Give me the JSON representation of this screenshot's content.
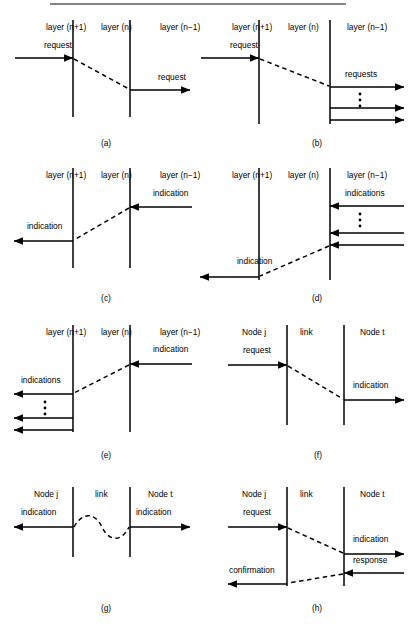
{
  "figure": {
    "width": 416,
    "height": 633,
    "background": "#ffffff",
    "ink_color": "#000000",
    "rule_color": "#5a5a5a",
    "separator_rule": {
      "x1": 50,
      "x2": 346,
      "y": 4
    }
  },
  "panels": [
    {
      "id": "panel-a",
      "caption": "(a)",
      "caption_pos": {
        "x": 106,
        "y": 146
      },
      "origin": {
        "x": 0,
        "y": 0
      },
      "columns": [
        {
          "name": "left",
          "label": "layer (n+1)",
          "label_x": 46,
          "label_y": 30,
          "line_x": 73,
          "line_y1": 20,
          "line_y2": 117
        },
        {
          "name": "middle",
          "label": "layer (n)",
          "label_x": 101,
          "label_y": 30,
          "line_x": 130,
          "line_y1": 20,
          "line_y2": 117
        },
        {
          "name": "right",
          "label": "layer (n−1)",
          "label_x": 160,
          "label_y": 30,
          "line_x": null,
          "line_y1": null,
          "line_y2": null
        }
      ],
      "arrows": [
        {
          "name": "request-in",
          "label": "request",
          "label_x": 44,
          "label_y": 48,
          "x1": 15,
          "y1": 58,
          "x2": 73,
          "y2": 58,
          "dir": "right"
        },
        {
          "name": "request-out",
          "label": "request",
          "label_x": 158,
          "label_y": 80,
          "x1": 130,
          "y1": 90,
          "x2": 190,
          "y2": 90,
          "dir": "right"
        }
      ],
      "mappings": [
        {
          "name": "request-mapping",
          "x1": 74,
          "y1": 59,
          "x2": 129,
          "y2": 89
        }
      ],
      "ellipses": []
    },
    {
      "id": "panel-b",
      "caption": "(b)",
      "caption_pos": {
        "x": 317,
        "y": 146
      },
      "origin": {
        "x": 0,
        "y": 0
      },
      "columns": [
        {
          "name": "left",
          "label": "layer (n+1)",
          "label_x": 232,
          "label_y": 30,
          "line_x": 259,
          "line_y1": 20,
          "line_y2": 124
        },
        {
          "name": "middle",
          "label": "layer (n)",
          "label_x": 288,
          "label_y": 30,
          "line_x": 330,
          "line_y1": 20,
          "line_y2": 124
        },
        {
          "name": "right",
          "label": "layer (n−1)",
          "label_x": 347,
          "label_y": 30,
          "line_x": null,
          "line_y1": null,
          "line_y2": null
        }
      ],
      "arrows": [
        {
          "name": "request-in",
          "label": "request",
          "label_x": 230,
          "label_y": 48,
          "x1": 201,
          "y1": 58,
          "x2": 259,
          "y2": 58,
          "dir": "right"
        },
        {
          "name": "requests-out-1",
          "label": "requests",
          "label_x": 345,
          "label_y": 77,
          "x1": 330,
          "y1": 87,
          "x2": 404,
          "y2": 87,
          "dir": "right"
        },
        {
          "name": "requests-out-2",
          "label": "",
          "label_x": 0,
          "label_y": 0,
          "x1": 330,
          "y1": 108,
          "x2": 404,
          "y2": 108,
          "dir": "right"
        },
        {
          "name": "requests-out-3",
          "label": "",
          "label_x": 0,
          "label_y": 0,
          "x1": 330,
          "y1": 120,
          "x2": 404,
          "y2": 120,
          "dir": "right"
        }
      ],
      "mappings": [
        {
          "name": "request-mapping",
          "x1": 260,
          "y1": 59,
          "x2": 329,
          "y2": 86
        }
      ],
      "ellipses": [
        {
          "name": "requests-ellipsis",
          "x": 360,
          "y_start": 94,
          "count": 3,
          "spacing": 6,
          "r": 1.4
        }
      ]
    },
    {
      "id": "panel-c",
      "caption": "(c)",
      "caption_pos": {
        "x": 106,
        "y": 301
      },
      "origin": {
        "x": 0,
        "y": 0
      },
      "columns": [
        {
          "name": "left",
          "label": "layer (n+1)",
          "label_x": 46,
          "label_y": 178,
          "line_x": 73,
          "line_y1": 168,
          "line_y2": 268
        },
        {
          "name": "middle",
          "label": "layer (n)",
          "label_x": 101,
          "label_y": 178,
          "line_x": 130,
          "line_y1": 168,
          "line_y2": 268
        },
        {
          "name": "right",
          "label": "layer (n−1)",
          "label_x": 160,
          "label_y": 178,
          "line_x": null,
          "line_y1": null,
          "line_y2": null
        }
      ],
      "arrows": [
        {
          "name": "indication-in",
          "label": "indication",
          "label_x": 153,
          "label_y": 196,
          "x1": 192,
          "y1": 207,
          "x2": 130,
          "y2": 207,
          "dir": "left"
        },
        {
          "name": "indication-out",
          "label": "indication",
          "label_x": 27,
          "label_y": 229,
          "x1": 73,
          "y1": 241,
          "x2": 14,
          "y2": 241,
          "dir": "left"
        }
      ],
      "mappings": [
        {
          "name": "indication-mapping",
          "x1": 129,
          "y1": 208,
          "x2": 74,
          "y2": 240
        }
      ],
      "ellipses": []
    },
    {
      "id": "panel-d",
      "caption": "(d)",
      "caption_pos": {
        "x": 317,
        "y": 301
      },
      "origin": {
        "x": 0,
        "y": 0
      },
      "columns": [
        {
          "name": "left",
          "label": "layer (n+1)",
          "label_x": 232,
          "label_y": 178,
          "line_x": 259,
          "line_y1": 168,
          "line_y2": 280
        },
        {
          "name": "middle",
          "label": "layer (n)",
          "label_x": 288,
          "label_y": 178,
          "line_x": 330,
          "line_y1": 168,
          "line_y2": 280
        },
        {
          "name": "right",
          "label": "layer (n−1)",
          "label_x": 347,
          "label_y": 178,
          "line_x": null,
          "line_y1": null,
          "line_y2": null
        }
      ],
      "arrows": [
        {
          "name": "indications-in-1",
          "label": "indications",
          "label_x": 345,
          "label_y": 196,
          "x1": 404,
          "y1": 206,
          "x2": 330,
          "y2": 206,
          "dir": "left"
        },
        {
          "name": "indications-in-2",
          "label": "",
          "label_x": 0,
          "label_y": 0,
          "x1": 404,
          "y1": 233,
          "x2": 330,
          "y2": 233,
          "dir": "left"
        },
        {
          "name": "indications-in-3",
          "label": "",
          "label_x": 0,
          "label_y": 0,
          "x1": 404,
          "y1": 245,
          "x2": 330,
          "y2": 245,
          "dir": "left"
        },
        {
          "name": "indication-out",
          "label": "indication",
          "label_x": 237,
          "label_y": 264,
          "x1": 259,
          "y1": 277,
          "x2": 200,
          "y2": 277,
          "dir": "left"
        }
      ],
      "mappings": [
        {
          "name": "indication-mapping",
          "x1": 329,
          "y1": 246,
          "x2": 260,
          "y2": 276
        }
      ],
      "ellipses": [
        {
          "name": "indications-ellipsis",
          "x": 360,
          "y_start": 214,
          "count": 3,
          "spacing": 6,
          "r": 1.4
        }
      ]
    },
    {
      "id": "panel-e",
      "caption": "(e)",
      "caption_pos": {
        "x": 106,
        "y": 458
      },
      "origin": {
        "x": 0,
        "y": 0
      },
      "columns": [
        {
          "name": "left",
          "label": "layer (n+1)",
          "label_x": 46,
          "label_y": 335,
          "line_x": 73,
          "line_y1": 325,
          "line_y2": 432
        },
        {
          "name": "middle",
          "label": "layer (n)",
          "label_x": 101,
          "label_y": 335,
          "line_x": 130,
          "line_y1": 325,
          "line_y2": 432
        },
        {
          "name": "right",
          "label": "layer (n−1)",
          "label_x": 160,
          "label_y": 335,
          "line_x": null,
          "line_y1": null,
          "line_y2": null
        }
      ],
      "arrows": [
        {
          "name": "indication-in",
          "label": "indication",
          "label_x": 153,
          "label_y": 352,
          "x1": 192,
          "y1": 364,
          "x2": 130,
          "y2": 364,
          "dir": "left"
        },
        {
          "name": "indications-out-1",
          "label": "indications",
          "label_x": 21,
          "label_y": 383,
          "x1": 73,
          "y1": 394,
          "x2": 14,
          "y2": 394,
          "dir": "left"
        },
        {
          "name": "indications-out-2",
          "label": "",
          "label_x": 0,
          "label_y": 0,
          "x1": 73,
          "y1": 418,
          "x2": 14,
          "y2": 418,
          "dir": "left"
        },
        {
          "name": "indications-out-3",
          "label": "",
          "label_x": 0,
          "label_y": 0,
          "x1": 73,
          "y1": 430,
          "x2": 14,
          "y2": 430,
          "dir": "left"
        }
      ],
      "mappings": [
        {
          "name": "indication-mapping",
          "x1": 129,
          "y1": 365,
          "x2": 74,
          "y2": 393
        }
      ],
      "ellipses": [
        {
          "name": "indications-ellipsis",
          "x": 45,
          "y_start": 402,
          "count": 3,
          "spacing": 6,
          "r": 1.4
        }
      ]
    },
    {
      "id": "panel-f",
      "caption": "(f)",
      "caption_pos": {
        "x": 318,
        "y": 458
      },
      "origin": {
        "x": 0,
        "y": 0
      },
      "columns": [
        {
          "name": "left",
          "label": "Node j",
          "label_x": 242,
          "label_y": 335,
          "line_x": 287,
          "line_y1": 325,
          "line_y2": 425
        },
        {
          "name": "middle",
          "label": "link",
          "label_x": 300,
          "label_y": 335,
          "line_x": 344,
          "line_y1": 325,
          "line_y2": 425
        },
        {
          "name": "right",
          "label": "Node t",
          "label_x": 360,
          "label_y": 335,
          "line_x": null,
          "line_y1": null,
          "line_y2": null
        }
      ],
      "arrows": [
        {
          "name": "request-in",
          "label": "request",
          "label_x": 243,
          "label_y": 353,
          "x1": 228,
          "y1": 365,
          "x2": 287,
          "y2": 365,
          "dir": "right"
        },
        {
          "name": "indication-out",
          "label": "indication",
          "label_x": 353,
          "label_y": 388,
          "x1": 344,
          "y1": 400,
          "x2": 404,
          "y2": 400,
          "dir": "right"
        }
      ],
      "mappings": [
        {
          "name": "request-indication-mapping",
          "x1": 288,
          "y1": 366,
          "x2": 343,
          "y2": 399
        }
      ],
      "ellipses": []
    },
    {
      "id": "panel-g",
      "caption": "(g)",
      "caption_pos": {
        "x": 106,
        "y": 611
      },
      "origin": {
        "x": 0,
        "y": 0
      },
      "columns": [
        {
          "name": "left",
          "label": "Node j",
          "label_x": 34,
          "label_y": 497,
          "line_x": 73,
          "line_y1": 487,
          "line_y2": 557
        },
        {
          "name": "middle",
          "label": "link",
          "label_x": 95,
          "label_y": 497,
          "line_x": 130,
          "line_y1": 487,
          "line_y2": 557
        },
        {
          "name": "right",
          "label": "Node t",
          "label_x": 148,
          "label_y": 497,
          "line_x": null,
          "line_y1": null,
          "line_y2": null
        }
      ],
      "arrows": [
        {
          "name": "indication-left",
          "label": "indication",
          "label_x": 21,
          "label_y": 515,
          "x1": 73,
          "y1": 527,
          "x2": 14,
          "y2": 527,
          "dir": "left"
        },
        {
          "name": "indication-right",
          "label": "indication",
          "label_x": 136,
          "label_y": 515,
          "x1": 130,
          "y1": 527,
          "x2": 190,
          "y2": 527,
          "dir": "right"
        }
      ],
      "mappings": [],
      "wave": {
        "name": "link-wave",
        "path": "M 74 527 C 82 512, 95 512, 102 527 C 109 542, 122 542, 129 527"
      },
      "ellipses": []
    },
    {
      "id": "panel-h",
      "caption": "(h)",
      "caption_pos": {
        "x": 317,
        "y": 611
      },
      "origin": {
        "x": 0,
        "y": 0
      },
      "columns": [
        {
          "name": "left",
          "label": "Node j",
          "label_x": 242,
          "label_y": 497,
          "line_x": 287,
          "line_y1": 487,
          "line_y2": 586
        },
        {
          "name": "middle",
          "label": "link",
          "label_x": 300,
          "label_y": 497,
          "line_x": 344,
          "line_y1": 487,
          "line_y2": 586
        },
        {
          "name": "right",
          "label": "Node t",
          "label_x": 360,
          "label_y": 497,
          "line_x": null,
          "line_y1": null,
          "line_y2": null
        }
      ],
      "arrows": [
        {
          "name": "request-in",
          "label": "request",
          "label_x": 243,
          "label_y": 515,
          "x1": 228,
          "y1": 527,
          "x2": 287,
          "y2": 527,
          "dir": "right"
        },
        {
          "name": "indication-out",
          "label": "indication",
          "label_x": 353,
          "label_y": 542,
          "x1": 344,
          "y1": 554,
          "x2": 404,
          "y2": 554,
          "dir": "right"
        },
        {
          "name": "response-in",
          "label": "response",
          "label_x": 353,
          "label_y": 563,
          "x1": 404,
          "y1": 573,
          "x2": 344,
          "y2": 573,
          "dir": "left"
        },
        {
          "name": "confirmation-out",
          "label": "confirmation",
          "label_x": 229,
          "label_y": 573,
          "x1": 287,
          "y1": 584,
          "x2": 228,
          "y2": 584,
          "dir": "left"
        }
      ],
      "mappings": [
        {
          "name": "request-indication-mapping",
          "x1": 288,
          "y1": 528,
          "x2": 343,
          "y2": 553
        },
        {
          "name": "response-confirmation-mapping",
          "x1": 343,
          "y1": 574,
          "x2": 288,
          "y2": 583
        }
      ],
      "ellipses": []
    }
  ]
}
